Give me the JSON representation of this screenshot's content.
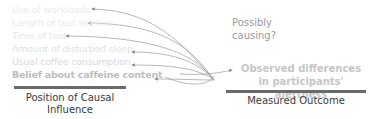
{
  "factors": [
    {
      "label": "Use of workloads"
    },
    {
      "label": "Length of test session"
    },
    {
      "label": "Time of test"
    },
    {
      "label": "Amount of disturbed sleep"
    },
    {
      "label": "Usual coffee consumption"
    },
    {
      "label": "Belief about caffeine content"
    }
  ],
  "question": {
    "line1": "Possibly",
    "line2": "causing?"
  },
  "outcome": {
    "line1": "Observed differences",
    "line2": "in participants' alertness"
  },
  "left_caption": {
    "line1": "Position of Causal",
    "line2": "Influence"
  },
  "right_caption": "Measured Outcome",
  "colors": {
    "bar": "#6a6a6a",
    "arrow": "#8a8a8a",
    "caption": "#3a3a3a"
  }
}
